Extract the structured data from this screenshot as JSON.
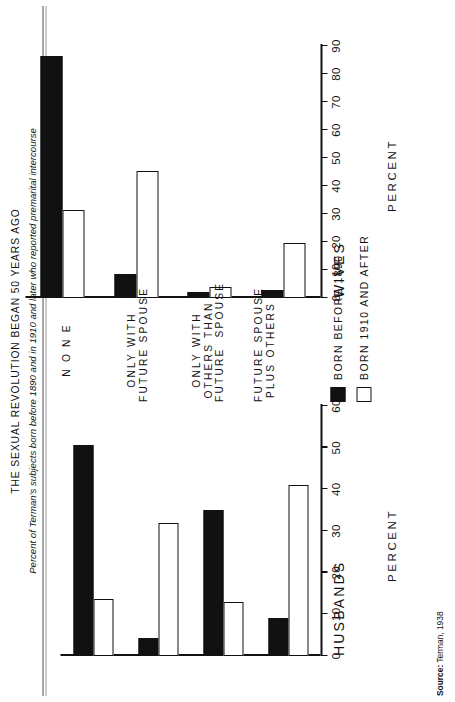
{
  "figure": {
    "title": "THE  SEXUAL  REVOLUTION  BEGAN  50  YEARS  AGO",
    "subtitle": "Percent of Terman's subjects born before 1890 and in 1910 and later who reported premarital intercourse",
    "source_label": "Source:",
    "source_text": "Terman, 1938"
  },
  "legend": {
    "items": [
      {
        "label": "BORN BEFORE 1890",
        "swatch": "dark",
        "color": "#111111"
      },
      {
        "label": "BORN 1910 AND AFTER",
        "swatch": "light",
        "color": "#ffffff"
      }
    ]
  },
  "categories": [
    "N O N E",
    "ONLY WITH\nFUTURE SPOUSE",
    "ONLY WITH\nOTHERS THAN\nFUTURE  SPOUSE",
    "FUTURE SPOUSE\nPLUS OTHERS"
  ],
  "chart_data": [
    {
      "type": "bar",
      "title": "HUSBANDS",
      "xlabel": "",
      "ylabel": "PERCENT",
      "ylim": [
        0,
        60
      ],
      "yticks": [
        0,
        10,
        20,
        30,
        40,
        50,
        60
      ],
      "grid": false,
      "legend_position": "center",
      "categories": [
        "N O N E",
        "ONLY WITH FUTURE SPOUSE",
        "ONLY WITH OTHERS THAN FUTURE SPOUSE",
        "FUTURE SPOUSE PLUS OTHERS"
      ],
      "series": [
        {
          "name": "BORN BEFORE 1890",
          "values": [
            50.6,
            4.3,
            35.0,
            9.0
          ]
        },
        {
          "name": "BORN 1910 AND AFTER",
          "values": [
            13.6,
            32.0,
            13.0,
            41.0
          ]
        }
      ]
    },
    {
      "type": "bar",
      "title": "WIVES",
      "xlabel": "",
      "ylabel": "PERCENT",
      "ylim": [
        0,
        90
      ],
      "yticks": [
        0,
        10,
        20,
        30,
        40,
        50,
        60,
        70,
        80,
        90
      ],
      "grid": false,
      "legend_position": "center",
      "categories": [
        "N O N E",
        "ONLY WITH FUTURE SPOUSE",
        "ONLY WITH OTHERS THAN FUTURE SPOUSE",
        "FUTURE SPOUSE PLUS OTHERS"
      ],
      "series": [
        {
          "name": "BORN BEFORE 1890",
          "values": [
            86.5,
            8.7,
            2.0,
            3.0
          ]
        },
        {
          "name": "BORN 1910 AND AFTER",
          "values": [
            31.5,
            45.5,
            4.0,
            19.5
          ]
        }
      ]
    }
  ]
}
